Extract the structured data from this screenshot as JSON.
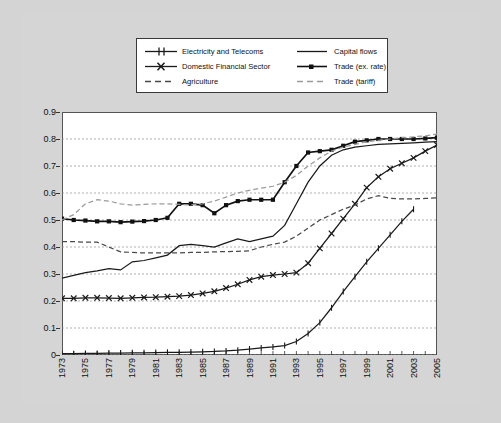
{
  "figure": {
    "background_color": "#d4d4d4",
    "plot_background_color": "#ffffff",
    "caption": ""
  },
  "legend": {
    "entries": [
      {
        "label": "Electricity and Telecoms",
        "style": "line-plus-markers",
        "color": "#1a1a1a",
        "marker": "plus"
      },
      {
        "label": "Capital flows",
        "style": "solid",
        "color": "#1a1a1a",
        "marker": "none"
      },
      {
        "label": "Domestic Financial Sector",
        "style": "line-plus-markers",
        "color": "#1a1a1a",
        "marker": "x"
      },
      {
        "label": "Trade (ex. rate)",
        "style": "line-plus-markers",
        "color": "#111111",
        "marker": "square"
      },
      {
        "label": "Agriculture",
        "style": "dashed",
        "color": "#4a4a4a",
        "marker": "none"
      },
      {
        "label": "Trade (tariff)",
        "style": "dashed",
        "color": "#9a9a9a",
        "marker": "none"
      }
    ]
  },
  "chart_data": {
    "type": "line",
    "title": "",
    "xlabel": "",
    "ylabel": "",
    "xlim": [
      1973,
      2005
    ],
    "ylim": [
      0,
      0.9
    ],
    "grid": true,
    "legend_position": "top-center",
    "ytick_labels": [
      "0",
      "0.1",
      "0.2",
      "0.3",
      "0.4",
      "0.5",
      "0.6",
      "0.7",
      "0.8",
      "0.9"
    ],
    "ytick_values": [
      0,
      0.1,
      0.2,
      0.3,
      0.4,
      0.5,
      0.6,
      0.7,
      0.8,
      0.9
    ],
    "xtick_labels": [
      "1973",
      "1975",
      "1977",
      "1979",
      "1981",
      "1983",
      "1985",
      "1987",
      "1989",
      "1991",
      "1993",
      "1995",
      "1997",
      "1999",
      "2001",
      "2003",
      "2005"
    ],
    "xtick_values": [
      1973,
      1975,
      1977,
      1979,
      1981,
      1983,
      1985,
      1987,
      1989,
      1991,
      1993,
      1995,
      1997,
      1999,
      2001,
      2003,
      2005
    ],
    "x": [
      1973,
      1974,
      1975,
      1976,
      1977,
      1978,
      1979,
      1980,
      1981,
      1982,
      1983,
      1984,
      1985,
      1986,
      1987,
      1988,
      1989,
      1990,
      1991,
      1992,
      1993,
      1994,
      1995,
      1996,
      1997,
      1998,
      1999,
      2000,
      2001,
      2002,
      2003,
      2004,
      2005
    ],
    "series": [
      {
        "name": "Electricity and Telecoms",
        "color": "#1a1a1a",
        "style": "solid",
        "marker": "plus",
        "values": [
          0.005,
          0.005,
          0.006,
          0.006,
          0.007,
          0.007,
          0.008,
          0.008,
          0.009,
          0.01,
          0.01,
          0.011,
          0.012,
          0.013,
          0.015,
          0.018,
          0.022,
          0.026,
          0.03,
          0.035,
          0.05,
          0.08,
          0.12,
          0.175,
          0.235,
          0.29,
          0.345,
          0.395,
          0.445,
          0.495,
          0.54,
          null,
          null
        ]
      },
      {
        "name": "Capital flows",
        "color": "#1a1a1a",
        "style": "solid",
        "marker": "none",
        "values": [
          0.285,
          0.295,
          0.305,
          0.312,
          0.32,
          0.315,
          0.345,
          0.35,
          0.36,
          0.37,
          0.405,
          0.41,
          0.405,
          0.4,
          0.415,
          0.43,
          0.42,
          0.43,
          0.44,
          0.48,
          0.56,
          0.64,
          0.7,
          0.74,
          0.76,
          0.77,
          0.775,
          0.78,
          0.782,
          0.784,
          0.786,
          0.788,
          0.79
        ]
      },
      {
        "name": "Domestic Financial Sector",
        "color": "#1a1a1a",
        "style": "solid",
        "marker": "x",
        "values": [
          0.21,
          0.21,
          0.212,
          0.212,
          0.211,
          0.21,
          0.212,
          0.213,
          0.214,
          0.216,
          0.218,
          0.222,
          0.228,
          0.236,
          0.248,
          0.262,
          0.278,
          0.29,
          0.296,
          0.3,
          0.305,
          0.34,
          0.395,
          0.45,
          0.505,
          0.56,
          0.62,
          0.66,
          0.69,
          0.71,
          0.73,
          0.755,
          0.778
        ]
      },
      {
        "name": "Trade (ex. rate)",
        "color": "#111111",
        "style": "solid",
        "marker": "square",
        "values": [
          0.505,
          0.5,
          0.498,
          0.495,
          0.495,
          0.492,
          0.494,
          0.496,
          0.5,
          0.508,
          0.56,
          0.56,
          0.555,
          0.525,
          0.555,
          0.57,
          0.575,
          0.575,
          0.575,
          0.64,
          0.7,
          0.75,
          0.755,
          0.76,
          0.775,
          0.79,
          0.795,
          0.8,
          0.8,
          0.8,
          0.8,
          0.802,
          0.805
        ]
      },
      {
        "name": "Agriculture",
        "color": "#4a4a4a",
        "style": "dashed",
        "marker": "none",
        "values": [
          0.42,
          0.42,
          0.418,
          0.418,
          0.4,
          0.382,
          0.38,
          0.378,
          0.378,
          0.378,
          0.378,
          0.38,
          0.38,
          0.382,
          0.383,
          0.384,
          0.386,
          0.4,
          0.41,
          0.418,
          0.44,
          0.47,
          0.5,
          0.52,
          0.54,
          0.555,
          0.578,
          0.59,
          0.58,
          0.578,
          0.578,
          0.58,
          0.582
        ]
      },
      {
        "name": "Trade (tariff)",
        "color": "#9a9a9a",
        "style": "dashed",
        "marker": "none",
        "values": [
          0.5,
          0.52,
          0.56,
          0.575,
          0.57,
          0.56,
          0.555,
          0.558,
          0.56,
          0.56,
          0.558,
          0.556,
          0.56,
          0.57,
          0.585,
          0.6,
          0.61,
          0.618,
          0.625,
          0.64,
          0.665,
          0.7,
          0.73,
          0.755,
          0.77,
          0.78,
          0.79,
          0.795,
          0.8,
          0.805,
          0.808,
          0.812,
          0.818
        ]
      }
    ]
  }
}
